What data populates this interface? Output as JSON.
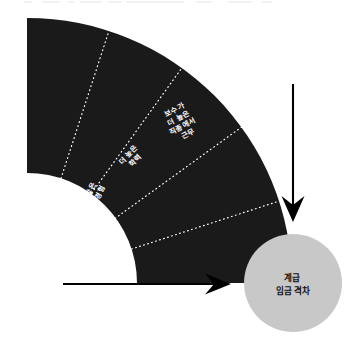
{
  "figure": {
    "type": "radial-stepped-arc-diagram",
    "background_color": "#ffffff",
    "arc_color": "#1a1a1a",
    "arc_divider_color": "#ffffff",
    "arrow_color": "#000000",
    "circle_fill": "#c8c8c8",
    "circle_text_color": "#111111",
    "segment_text_color": "#ffffff"
  },
  "arc": {
    "segments": [
      {
        "id": "segment-1",
        "lines": [
          "더 큰",
          "회사에서",
          "근무"
        ],
        "text": "더 큰 회사에서 근무"
      },
      {
        "id": "segment-2",
        "lines": [
          "더 많은",
          "일 경험"
        ],
        "text": "더 많은 일 경험"
      },
      {
        "id": "segment-3",
        "lines": [
          "더 높은",
          "학력"
        ],
        "text": "더 높은 학력"
      },
      {
        "id": "segment-4",
        "lines": [
          "보수가",
          "더 높은",
          "직종에서",
          "근무"
        ],
        "text": "보수가 더 높은 직종에서 근무"
      },
      {
        "id": "segment-5",
        "lines": [
          "런던에서",
          "근무"
        ],
        "text": "런던에서 근무"
      }
    ]
  },
  "target": {
    "id": "outcome-circle",
    "lines": [
      "계급",
      "임금 격차"
    ],
    "text": "계급 임금 격차"
  },
  "arrows": [
    {
      "id": "arrow-vertical",
      "direction": "down"
    },
    {
      "id": "arrow-horizontal",
      "direction": "right"
    }
  ]
}
